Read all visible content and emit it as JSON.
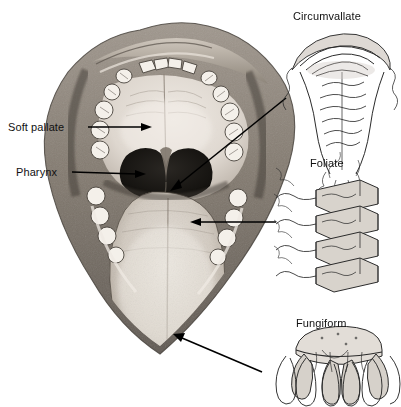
{
  "figure": {
    "type": "anatomical-illustration",
    "style": "grayscale pencil/stipple medical drawing on white background",
    "background_color": "#ffffff",
    "ink_color": "#111111"
  },
  "main_illustration": {
    "name": "open-mouth-view",
    "description": "Frontal view into an open mouth showing upper and lower dental arches, hard and soft palate, dark pharyngeal opening with uvula, and a protruding tongue.",
    "parts": [
      "upper-lip",
      "upper-teeth-arch",
      "hard-palate",
      "soft-palate",
      "uvula",
      "pharynx-opening",
      "tongue-dorsum",
      "lower-teeth-arch",
      "cheek-mucosa"
    ]
  },
  "callout_labels": [
    {
      "id": "soft-pallate",
      "text": "Soft pallate",
      "x": 8,
      "y": 121,
      "arrow": {
        "x1": 88,
        "y1": 127,
        "x2": 148,
        "y2": 127,
        "head": "end"
      }
    },
    {
      "id": "pharynx",
      "text": "Pharynx",
      "x": 16,
      "y": 166,
      "arrow": {
        "x1": 72,
        "y1": 172,
        "x2": 142,
        "y2": 174,
        "head": "end"
      }
    }
  ],
  "panels": [
    {
      "id": "circumvallate",
      "title": "Circumvallate",
      "title_x": 293,
      "title_y": 10,
      "description": "Large dome-shaped papilla surrounded by a circular trench, with nerve fibers branching below.",
      "leader": {
        "x1": 172,
        "y1": 182,
        "x2": 286,
        "y2": 98,
        "head": "start"
      }
    },
    {
      "id": "foliate",
      "title": "Foliate",
      "title_x": 310,
      "title_y": 157,
      "description": "Stack of parallel vertical ridges and clefts along the lateral tongue border.",
      "leader": {
        "x1": 276,
        "y1": 222,
        "x2": 192,
        "y2": 222,
        "head": "end"
      }
    },
    {
      "id": "fungiform",
      "title": "Fungiform",
      "title_x": 296,
      "title_y": 317,
      "description": "Mushroom-shaped papilla with a broad flat cap over finger-like projections.",
      "leader": {
        "x1": 262,
        "y1": 372,
        "x2": 175,
        "y2": 335,
        "head": "end"
      }
    }
  ]
}
